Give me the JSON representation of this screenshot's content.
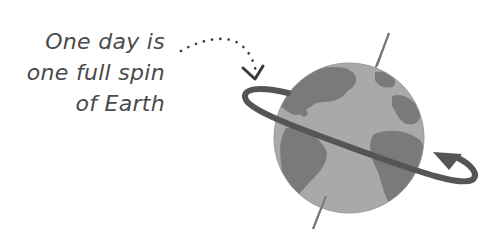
{
  "caption": {
    "lines": [
      "One day is",
      "one full spin",
      "of Earth"
    ]
  },
  "diagram": {
    "icons": [
      "dotted-pointer-arrow-icon",
      "globe-icon",
      "rotation-orbit-arrow-icon",
      "axis-line"
    ],
    "colors": {
      "text": "#4a4a4a",
      "ocean": "#a9a9a9",
      "land": "#7a7a7a",
      "ring": "#555555",
      "axis": "#777777"
    }
  }
}
